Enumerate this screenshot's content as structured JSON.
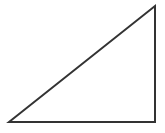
{
  "figure": {
    "name": "right-triangle",
    "canvas": {
      "width": 165,
      "height": 133,
      "background_color": "#ffffff"
    },
    "shape": {
      "type": "polygon",
      "sides": 3,
      "kind": "right-triangle",
      "right_angle_vertex": "bottom-right",
      "fill": "none",
      "stroke_color": "#333333",
      "stroke_width": 2,
      "vertices": [
        {
          "label": "bottom-left",
          "x": 9,
          "y": 122
        },
        {
          "label": "top-right",
          "x": 155,
          "y": 6
        },
        {
          "label": "bottom-right",
          "x": 155,
          "y": 122
        }
      ],
      "edges": [
        {
          "label": "hypotenuse",
          "from": "bottom-left",
          "to": "top-right"
        },
        {
          "label": "vertical-leg",
          "from": "top-right",
          "to": "bottom-right"
        },
        {
          "label": "horizontal-leg",
          "from": "bottom-right",
          "to": "bottom-left"
        }
      ],
      "points_attribute": "9,122 155,6 155,122"
    }
  }
}
